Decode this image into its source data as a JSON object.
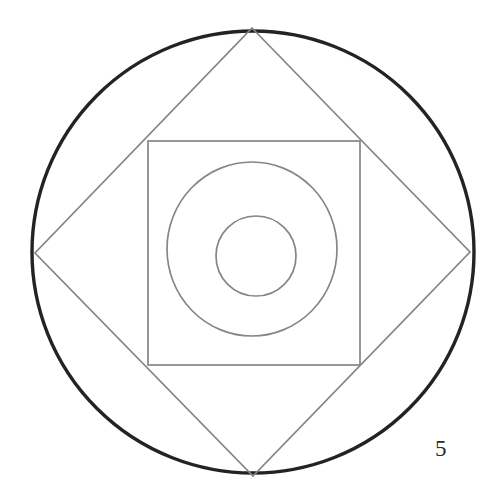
{
  "figure": {
    "caption": "5",
    "background_color": "#ffffff",
    "canvas": {
      "width": 493,
      "height": 499
    }
  },
  "styles": {
    "outer_stroke_color": "#232323",
    "inner_stroke_color": "#858585",
    "outer_stroke_width": 3.4,
    "inner_stroke_width": 1.7,
    "fill": "none"
  },
  "chart_data": {
    "type": "diagram",
    "shapes": [
      {
        "name": "outer-circle",
        "kind": "circle",
        "cx": 253,
        "cy": 252,
        "r": 221,
        "stroke": "#232323",
        "stroke_width": 3.4,
        "emphasis": "bold"
      },
      {
        "name": "inscribed-diamond",
        "kind": "polygon",
        "points": "252,28 470,252 253,476 35,253",
        "vertices": [
          {
            "label": "top",
            "x": 252,
            "y": 28
          },
          {
            "label": "right",
            "x": 470,
            "y": 252
          },
          {
            "label": "bottom",
            "x": 253,
            "y": 476
          },
          {
            "label": "left",
            "x": 35,
            "y": 253
          }
        ],
        "stroke": "#858585",
        "stroke_width": 1.7
      },
      {
        "name": "inner-square",
        "kind": "rect",
        "x": 148,
        "y": 141,
        "width": 212,
        "height": 224,
        "stroke": "#858585",
        "stroke_width": 1.7
      },
      {
        "name": "medium-circle",
        "kind": "ellipse",
        "cx": 252,
        "cy": 249,
        "rx": 85,
        "ry": 87,
        "stroke": "#858585",
        "stroke_width": 1.7
      },
      {
        "name": "inner-circle",
        "kind": "circle",
        "cx": 256,
        "cy": 256,
        "r": 40,
        "stroke": "#858585",
        "stroke_width": 1.7
      }
    ],
    "annotations": [
      {
        "name": "figure-number",
        "text": "5",
        "x": 441,
        "y": 452
      }
    ]
  }
}
